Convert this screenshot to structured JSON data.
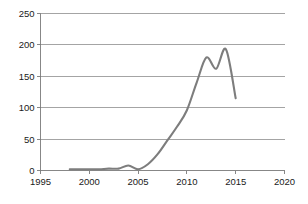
{
  "chart_data": {
    "type": "line",
    "title": "",
    "subtitle": "",
    "xlabel": "",
    "ylabel": "",
    "xlim": [
      1995,
      2020
    ],
    "ylim": [
      0,
      250
    ],
    "grid": true,
    "legend": false,
    "legend_position": "none",
    "line_color": "#7d7d7d",
    "gridline_color": "#9a9a9a",
    "background_color": "#ffffff",
    "x_ticks": [
      1995,
      2000,
      2005,
      2010,
      2015,
      2020
    ],
    "x_tick_labels": [
      "1995",
      "2000",
      "2005",
      "2010",
      "2015",
      "2020"
    ],
    "y_ticks": [
      0,
      50,
      100,
      150,
      200,
      250
    ],
    "y_tick_labels": [
      "0",
      "50",
      "100",
      "150",
      "200",
      "250"
    ],
    "x": [
      1998,
      1999,
      2000,
      2001,
      2002,
      2003,
      2004,
      2005,
      2006,
      2007,
      2008,
      2009,
      2010,
      2011,
      2012,
      2013,
      2014,
      2015
    ],
    "values": [
      2,
      2,
      2,
      2,
      3,
      3,
      8,
      2,
      10,
      26,
      48,
      70,
      96,
      140,
      180,
      162,
      193,
      115
    ],
    "series": [
      {
        "name": "",
        "color": "#7d7d7d",
        "values": [
          2,
          2,
          2,
          2,
          3,
          3,
          8,
          2,
          10,
          26,
          48,
          70,
          96,
          140,
          180,
          162,
          193,
          115
        ]
      }
    ],
    "annotations": []
  },
  "axes": {
    "y_axis_name": "value-axis",
    "x_axis_name": "year-axis"
  }
}
